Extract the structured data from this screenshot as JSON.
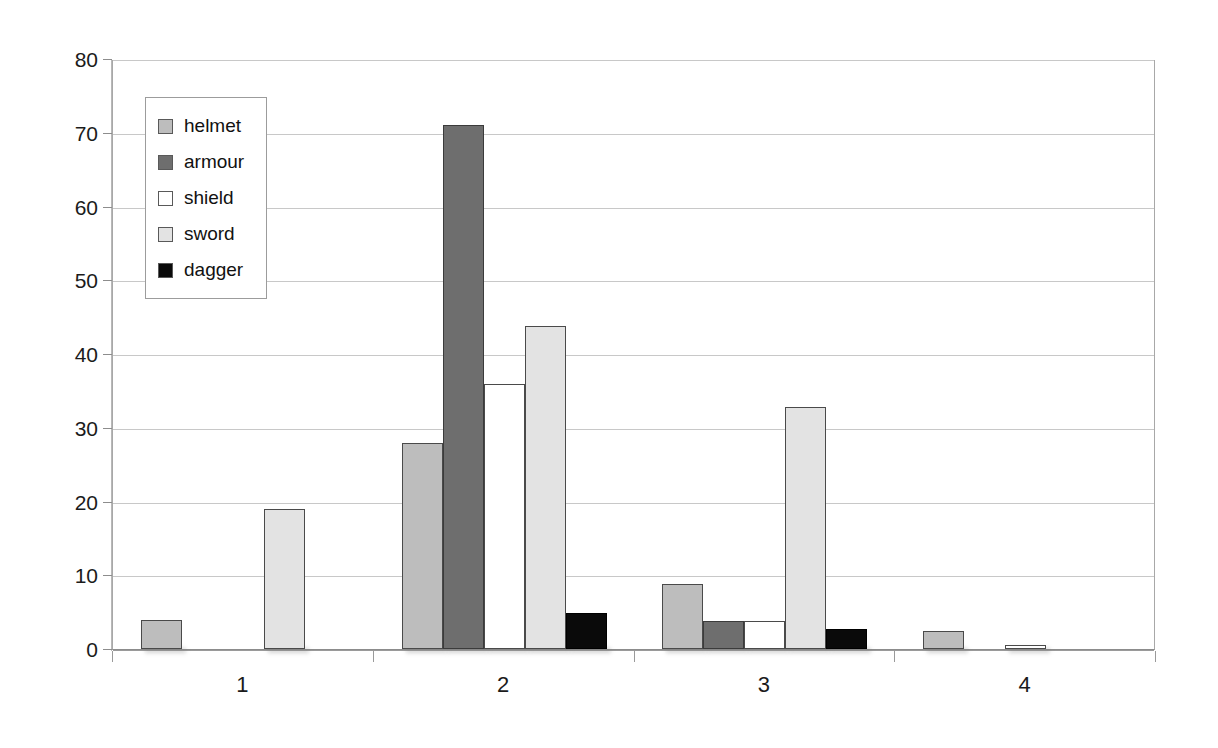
{
  "chart_data": {
    "type": "bar",
    "title": "",
    "subtitle": "",
    "xlabel": "",
    "ylabel": "",
    "categories": [
      "1",
      "2",
      "3",
      "4"
    ],
    "series": [
      {
        "name": "helmet",
        "color": "#bdbdbd",
        "values": [
          4,
          28,
          8.8,
          2.4
        ]
      },
      {
        "name": "armour",
        "color": "#6e6e6e",
        "values": [
          0,
          71,
          3.8,
          0
        ]
      },
      {
        "name": "shield",
        "color": "#ffffff",
        "values": [
          0,
          36,
          3.8,
          0.5
        ]
      },
      {
        "name": "sword",
        "color": "#e3e3e3",
        "values": [
          19,
          43.8,
          32.8,
          0
        ]
      },
      {
        "name": "dagger",
        "color": "#0a0a0a",
        "values": [
          0,
          4.9,
          2.7,
          0
        ]
      }
    ],
    "ylim": [
      0,
      80
    ],
    "ytick_labels": [
      "0",
      "10",
      "20",
      "30",
      "40",
      "50",
      "60",
      "70",
      "80"
    ],
    "ytick_values": [
      0,
      10,
      20,
      30,
      40,
      50,
      60,
      70,
      80
    ],
    "grid": true,
    "grid_axis": "y",
    "legend": {
      "position": "top-left-inside",
      "entries": [
        {
          "label": "helmet",
          "color": "#bdbdbd"
        },
        {
          "label": "armour",
          "color": "#6e6e6e"
        },
        {
          "label": "shield",
          "color": "#ffffff"
        },
        {
          "label": "sword",
          "color": "#e3e3e3"
        },
        {
          "label": "dagger",
          "color": "#0a0a0a"
        }
      ]
    },
    "axis_colors": {
      "grid": "#c8c8c8",
      "frame": "#a8a8a8",
      "tick_label": "#1b1b1b"
    }
  }
}
